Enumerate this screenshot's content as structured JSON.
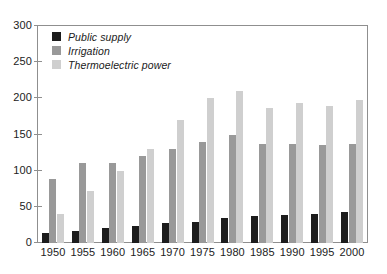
{
  "chart_data": {
    "type": "bar",
    "title": "",
    "xlabel": "",
    "ylabel": "",
    "ylim": [
      0,
      300
    ],
    "yticks": [
      0,
      50,
      100,
      150,
      200,
      250,
      300
    ],
    "grid": false,
    "legend_position": "top-left",
    "categories": [
      "1950",
      "1955",
      "1960",
      "1965",
      "1970",
      "1975",
      "1980",
      "1985",
      "1990",
      "1995",
      "2000"
    ],
    "series": [
      {
        "name": "Public supply",
        "color": "#1c1c1c",
        "values": [
          14,
          17,
          21,
          24,
          27,
          29,
          34,
          37,
          39,
          40,
          43
        ]
      },
      {
        "name": "Irrigation",
        "color": "#999999",
        "values": [
          89,
          110,
          110,
          120,
          130,
          140,
          150,
          137,
          137,
          135,
          137
        ]
      },
      {
        "name": "Thermoelectric power",
        "color": "#cfcfcf",
        "values": [
          40,
          72,
          100,
          130,
          170,
          200,
          210,
          187,
          194,
          190,
          198
        ]
      }
    ]
  },
  "legend": {
    "items": [
      {
        "label": "Public supply",
        "color": "#1c1c1c"
      },
      {
        "label": "Irrigation",
        "color": "#999999"
      },
      {
        "label": "Thermoelectric power",
        "color": "#cfcfcf"
      }
    ]
  }
}
